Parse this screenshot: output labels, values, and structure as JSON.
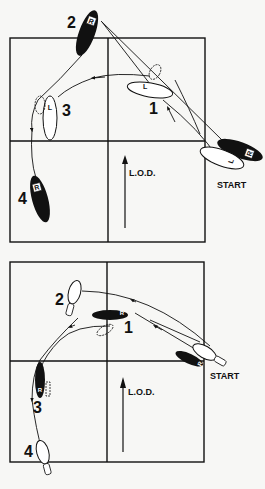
{
  "diagrams": [
    {
      "id": "top",
      "title": "Man's steps",
      "start_label": "START",
      "lod_label": "L.O.D.",
      "steps": [
        {
          "number": "1",
          "foot": "L",
          "fill": "white"
        },
        {
          "number": "2",
          "foot": "R",
          "fill": "black"
        },
        {
          "number": "3",
          "foot": "L",
          "fill": "white"
        },
        {
          "number": "4",
          "foot": "R",
          "fill": "black"
        }
      ],
      "start_feet": [
        {
          "foot": "R",
          "fill": "black"
        },
        {
          "foot": "L",
          "fill": "white"
        }
      ]
    },
    {
      "id": "bottom",
      "title": "Lady's steps",
      "start_label": "START",
      "lod_label": "L.O.D.",
      "steps": [
        {
          "number": "1",
          "foot": "R",
          "fill": "black"
        },
        {
          "number": "2",
          "foot": "L",
          "fill": "white"
        },
        {
          "number": "3",
          "foot": "R",
          "fill": "black"
        },
        {
          "number": "4",
          "foot": "L",
          "fill": "white"
        }
      ],
      "start_feet": [
        {
          "foot": "R",
          "fill": "black"
        },
        {
          "foot": "L",
          "fill": "white"
        }
      ]
    }
  ],
  "colors": {
    "ink": "#111111",
    "paper": "#f7f7f5"
  }
}
